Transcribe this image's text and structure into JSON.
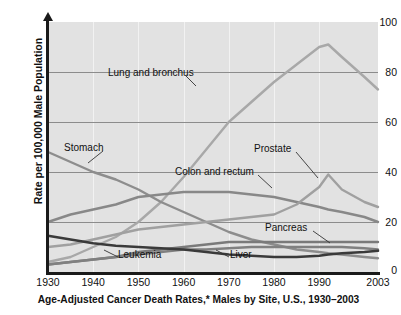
{
  "chart_data": {
    "type": "line",
    "title": "Age-Adjusted Cancer Death Rates,* Males by Site, U.S., 1930–2003",
    "xlabel": "",
    "ylabel": "Rate per 100,000 Male Population",
    "xlim": [
      1930,
      2003
    ],
    "ylim": [
      0,
      100
    ],
    "grid": true,
    "legend_position": "inline-annotations",
    "xticks": [
      "1930",
      "1940",
      "1950",
      "1960",
      "1970",
      "1980",
      "1990",
      "2003"
    ],
    "xtick_values": [
      1930,
      1940,
      1950,
      1960,
      1970,
      1980,
      1990,
      2003
    ],
    "yticks": [
      "0",
      "20",
      "40",
      "60",
      "80",
      "100"
    ],
    "ytick_values": [
      0,
      20,
      40,
      60,
      80,
      100
    ],
    "x": [
      1930,
      1935,
      1940,
      1945,
      1950,
      1955,
      1960,
      1965,
      1970,
      1975,
      1980,
      1985,
      1990,
      1992,
      1995,
      2000,
      2003
    ],
    "series": [
      {
        "name": "Lung and bronchus",
        "color": "#a8a8a8",
        "values": [
          4,
          6,
          10,
          14,
          20,
          28,
          38,
          49,
          60,
          68,
          76,
          83,
          90,
          91,
          86,
          78,
          73
        ]
      },
      {
        "name": "Stomach",
        "color": "#8d8d8d",
        "values": [
          48,
          44,
          40,
          37,
          33,
          28,
          24,
          20,
          16,
          13,
          11,
          9,
          8,
          7.5,
          7,
          6,
          5.5
        ]
      },
      {
        "name": "Colon and rectum",
        "color": "#888888",
        "values": [
          20,
          23,
          25,
          27,
          30,
          31,
          32,
          32,
          32,
          31,
          30,
          28,
          26,
          25,
          24,
          22,
          20
        ]
      },
      {
        "name": "Prostate",
        "color": "#a0a0a0",
        "values": [
          10,
          11,
          13,
          15,
          17,
          18,
          19,
          20,
          21,
          22,
          23,
          27,
          34,
          39,
          33,
          28,
          26
        ]
      },
      {
        "name": "Pancreas",
        "color": "#7a7a7a",
        "values": [
          3,
          4,
          5,
          6,
          8,
          9,
          10,
          11,
          12,
          12,
          12,
          12,
          12,
          12,
          12,
          12,
          12
        ]
      },
      {
        "name": "Leukemia",
        "color": "#808080",
        "values": [
          3,
          4,
          5,
          6,
          7,
          8,
          9,
          9,
          9.5,
          10,
          10,
          10,
          10,
          10,
          10,
          9.5,
          9
        ]
      },
      {
        "name": "Liver",
        "color": "#3a3a3a",
        "values": [
          14.5,
          13,
          11.5,
          10.5,
          10,
          9.5,
          9,
          8,
          7,
          6.5,
          6,
          6,
          6.5,
          7,
          7.5,
          8,
          8.5
        ]
      }
    ],
    "annotations": [
      {
        "label": "Lung and bronchus",
        "x": 108,
        "y": 74
      },
      {
        "label": "Stomach",
        "x": 66,
        "y": 148
      },
      {
        "label": "Colon and rectum",
        "x": 178,
        "y": 170
      },
      {
        "label": "Prostate",
        "x": 254,
        "y": 150
      },
      {
        "label": "Pancreas",
        "x": 265,
        "y": 228
      },
      {
        "label": "Leukemia",
        "x": 120,
        "y": 256
      },
      {
        "label": "Liver",
        "x": 200,
        "y": 256
      }
    ]
  }
}
